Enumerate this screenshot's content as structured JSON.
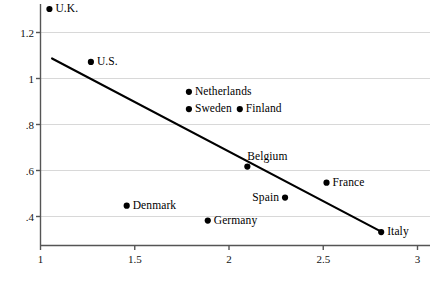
{
  "chart_data": {
    "type": "scatter",
    "title": "",
    "subtitle": "",
    "xlabel": "",
    "ylabel": "",
    "xlim": [
      0.92,
      3.05
    ],
    "ylim": [
      0.3,
      1.345
    ],
    "grid": "horizontal",
    "legend": "none",
    "xticks": [
      {
        "value": 1,
        "label": "1"
      },
      {
        "value": 1.5,
        "label": "1.5"
      },
      {
        "value": 2,
        "label": "2"
      },
      {
        "value": 2.5,
        "label": "2.5"
      },
      {
        "value": 3,
        "label": "3"
      }
    ],
    "yticks": [
      {
        "value": 1.2,
        "label": "1.2"
      },
      {
        "value": 1.0,
        "label": "1"
      },
      {
        "value": 0.8,
        "label": ".8"
      },
      {
        "value": 0.6,
        "label": ".6"
      },
      {
        "value": 0.4,
        "label": ".4"
      }
    ],
    "points": [
      {
        "label": "U.K.",
        "x": 1.05,
        "y": 1.3,
        "anchor": "left"
      },
      {
        "label": "U.S.",
        "x": 1.27,
        "y": 1.07,
        "anchor": "left"
      },
      {
        "label": "Netherlands",
        "x": 1.79,
        "y": 0.94,
        "anchor": "left"
      },
      {
        "label": "Sweden",
        "x": 1.79,
        "y": 0.865,
        "anchor": "left"
      },
      {
        "label": "Finland",
        "x": 2.06,
        "y": 0.865,
        "anchor": "left"
      },
      {
        "label": "Belgium",
        "x": 2.1,
        "y": 0.615,
        "anchor": "above"
      },
      {
        "label": "France",
        "x": 2.52,
        "y": 0.545,
        "anchor": "left"
      },
      {
        "label": "Spain",
        "x": 2.3,
        "y": 0.48,
        "anchor": "right"
      },
      {
        "label": "Denmark",
        "x": 1.46,
        "y": 0.445,
        "anchor": "left"
      },
      {
        "label": "Germany",
        "x": 1.89,
        "y": 0.38,
        "anchor": "left"
      },
      {
        "label": "Italy",
        "x": 2.81,
        "y": 0.33,
        "anchor": "left"
      }
    ],
    "fit_line": {
      "name": "regression-line",
      "x1": 1.064,
      "y1": 1.085,
      "x2": 2.815,
      "y2": 0.33
    },
    "colors": {
      "marker": "#000000",
      "line": "#000000",
      "grid": "#d8d8d8",
      "axis": "#555555",
      "text": "#111111",
      "background": "#ffffff"
    }
  }
}
